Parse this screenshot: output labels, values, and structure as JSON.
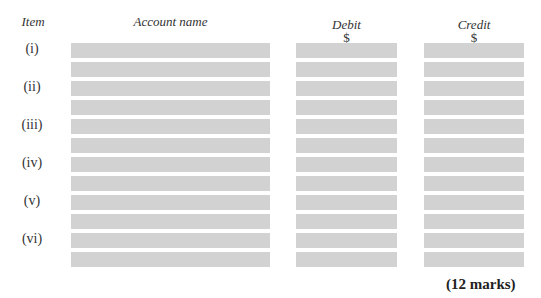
{
  "headers": {
    "item": "Item",
    "account_name": "Account name",
    "debit": "Debit",
    "debit_currency": "$",
    "credit": "Credit",
    "credit_currency": "$"
  },
  "items": [
    "(i)",
    "(ii)",
    "(iii)",
    "(iv)",
    "(v)",
    "(vi)"
  ],
  "rows_per_item": 2,
  "marks": "(12 marks)",
  "colors": {
    "answer_bar": "#d2d2d2"
  }
}
